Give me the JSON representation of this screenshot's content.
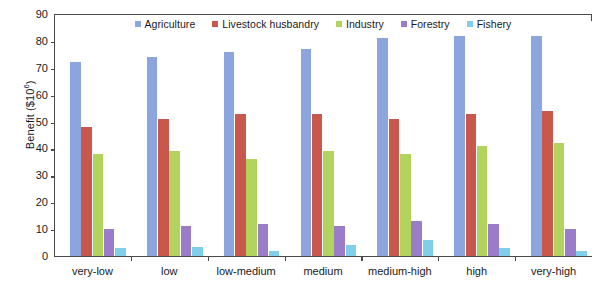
{
  "chart_data": {
    "type": "bar",
    "title": "",
    "xlabel": "",
    "ylabel": "Benefit ($10^6)",
    "ylabel_base": "Benefit ($10",
    "ylabel_exponent": "6",
    "ylabel_suffix": ")",
    "ylim": [
      0,
      90
    ],
    "ytick_step": 10,
    "yticks": [
      0,
      10,
      20,
      30,
      40,
      50,
      60,
      70,
      80,
      90
    ],
    "ytick_labels": [
      "0",
      "10",
      "20",
      "30",
      "40",
      "50",
      "60",
      "70",
      "80",
      "90"
    ],
    "grid": false,
    "legend_position": "inside-top-center",
    "categories": [
      "very-low",
      "low",
      "low-medium",
      "medium",
      "medium-high",
      "high",
      "very-high"
    ],
    "series": [
      {
        "name": "Agriculture",
        "color": "#8DA5DF",
        "values": [
          72,
          74,
          76,
          77,
          81,
          82,
          82
        ]
      },
      {
        "name": "Livestock husbandry",
        "color": "#C8584B",
        "values": [
          48,
          51,
          53,
          53,
          51,
          53,
          54
        ]
      },
      {
        "name": "Industry",
        "color": "#B2D45F",
        "values": [
          38,
          39,
          36,
          39,
          38,
          41,
          42
        ]
      },
      {
        "name": "Forestry",
        "color": "#9B7CC8",
        "values": [
          10,
          11,
          12,
          11,
          13,
          12,
          10
        ]
      },
      {
        "name": "Fishery",
        "color": "#7FCFE8",
        "values": [
          3,
          3.5,
          2,
          4,
          6,
          3,
          2
        ]
      }
    ]
  },
  "axis": {
    "frame_color": "#4a4a4a",
    "text_color": "#1a1a1a"
  }
}
